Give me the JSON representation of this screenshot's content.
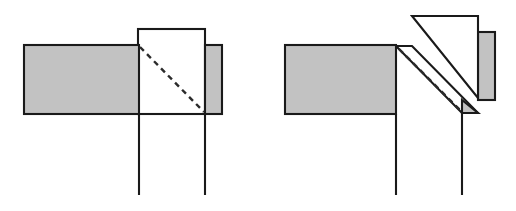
{
  "figure": {
    "title": "Beam to column connection detail comparison",
    "canvas": {
      "width": 516,
      "height": 211,
      "background": "#ffffff"
    },
    "palette": {
      "member_fill_gray": "#c2c2c2",
      "member_fill_white": "#ffffff",
      "outline_stroke": "#1a1a1a",
      "dashed_stroke": "#2b2b2b"
    },
    "panels": [
      {
        "id": "left",
        "name": "straight-vertical-joint",
        "caption": "",
        "elements": [
          {
            "name": "horizontal-beam",
            "fill": "gray",
            "x": 24,
            "y": 45,
            "width": 115,
            "height": 69
          },
          {
            "name": "column-white-web",
            "fill": "white",
            "x": 138,
            "y": 29,
            "width": 67,
            "height": 85
          },
          {
            "name": "right-stub-beam",
            "fill": "gray",
            "x": 205,
            "y": 45,
            "width": 17,
            "height": 69
          },
          {
            "name": "column-left-leg",
            "x1": 139,
            "y1": 114,
            "x2": 139,
            "y2": 195
          },
          {
            "name": "column-right-leg",
            "x1": 205,
            "y1": 114,
            "x2": 205,
            "y2": 195
          },
          {
            "name": "dashed-failure-plane",
            "x1": 140,
            "y1": 47,
            "x2": 204,
            "y2": 112
          }
        ]
      },
      {
        "id": "right",
        "name": "inclined-splice-joint",
        "caption": "",
        "elements": [
          {
            "name": "horizontal-beam",
            "fill": "gray",
            "x": 285,
            "y": 45,
            "width": 111,
            "height": 69
          },
          {
            "name": "inclined-splice-plate",
            "fill": "white",
            "points": "412,16 478,16 478,98"
          },
          {
            "name": "right-stub-beam",
            "fill": "gray",
            "x": 478,
            "y": 32,
            "width": 17,
            "height": 68
          },
          {
            "name": "inclined-beam-band",
            "fill": "white",
            "points": "396,46 412,46 478,113 462,113"
          },
          {
            "name": "bearing-wedge",
            "fill": "gray",
            "points": "462,100 478,113 462,113"
          },
          {
            "name": "column-left-leg",
            "x1": 396,
            "y1": 114,
            "x2": 396,
            "y2": 195
          },
          {
            "name": "column-right-leg",
            "x1": 462,
            "y1": 113,
            "x2": 462,
            "y2": 195
          },
          {
            "name": "dashed-failure-plane",
            "x1": 399,
            "y1": 49,
            "x2": 461,
            "y2": 111
          }
        ]
      }
    ]
  }
}
